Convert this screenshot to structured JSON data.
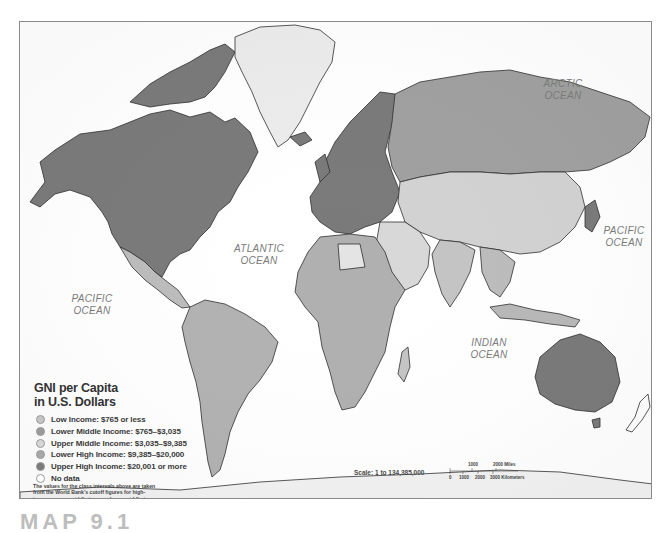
{
  "map": {
    "title": "GNI per Capita in U.S. Dollars",
    "oceans": [
      {
        "name": "ARCTIC",
        "sub": "OCEAN",
        "x": 547,
        "y": 78
      },
      {
        "name": "ATLANTIC",
        "sub": "OCEAN",
        "x": 258,
        "y": 244
      },
      {
        "name": "PACIFIC",
        "sub": "OCEAN",
        "x": 90,
        "y": 293
      },
      {
        "name": "PACIFIC",
        "sub": "OCEAN",
        "x": 625,
        "y": 225
      },
      {
        "name": "INDIAN",
        "sub": "OCEAN",
        "x": 487,
        "y": 337
      }
    ],
    "colors": {
      "low_income": "#c4c4c4",
      "lower_middle_income": "#9a9a9a",
      "upper_middle_income": "#d6d6d6",
      "lower_high_income": "#a8a8a8",
      "upper_high_income": "#7a7a7a",
      "no_data": "#ffffff",
      "ocean": "#ffffff",
      "border": "#333333"
    }
  },
  "legend": {
    "title_line1": "GNI per Capita",
    "title_line2": "in U.S. Dollars",
    "items": [
      {
        "label": "Low Income: $765 or less",
        "color": "#c4c4c4"
      },
      {
        "label": "Lower Middle Income: $765–$3,035",
        "color": "#9a9a9a"
      },
      {
        "label": "Upper Middle Income: $3,035–$9,385",
        "color": "#d6d6d6"
      },
      {
        "label": "Lower High Income: $9,385–$20,000",
        "color": "#a8a8a8"
      },
      {
        "label": "Upper High Income: $20,001 or more",
        "color": "#7a7a7a"
      },
      {
        "label": "No data",
        "color": "#ffffff"
      }
    ],
    "note": "The values for the class intervals above are taken from the World Bank’s cutoff figures for high-income, upper-middle-income, lower-middle-income, and low-income economies."
  },
  "scale": {
    "text": "Scale: 1 to 134,385,000",
    "miles_ticks": [
      "1000",
      "2000 Miles"
    ],
    "km_ticks": [
      "0",
      "1000",
      "2000",
      "3000 Kilometers"
    ]
  },
  "page": {
    "heading": "MAP 9.1"
  }
}
